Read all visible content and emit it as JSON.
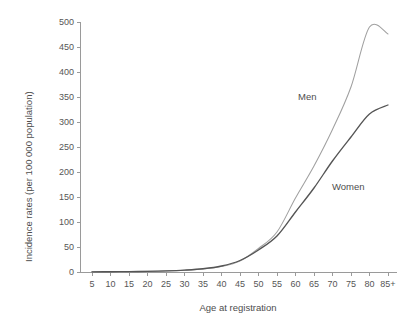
{
  "chart_data": {
    "type": "line",
    "title": "",
    "xlabel": "Age at registration",
    "ylabel": "Incidence rates (per 100 000 population)",
    "categories": [
      "5",
      "10",
      "15",
      "20",
      "25",
      "30",
      "35",
      "40",
      "45",
      "50",
      "55",
      "60",
      "65",
      "70",
      "75",
      "80",
      "85+"
    ],
    "x_tick_labels": [
      "5",
      "10",
      "15",
      "20",
      "25",
      "30",
      "35",
      "40",
      "45",
      "50",
      "55",
      "60",
      "65",
      "70",
      "75",
      "80",
      "85+"
    ],
    "y_tick_labels": [
      "0",
      "50",
      "100",
      "150",
      "200",
      "250",
      "300",
      "350",
      "400",
      "450",
      "500"
    ],
    "y_tick_values": [
      0,
      50,
      100,
      150,
      200,
      250,
      300,
      350,
      400,
      450,
      500
    ],
    "ylim": [
      0,
      500
    ],
    "grid": false,
    "legend_position": "inline-annotation",
    "series": [
      {
        "name": "Men",
        "color": "#a0a0a0",
        "values": [
          0.4,
          0.6,
          0.9,
          1.3,
          2.0,
          3.4,
          6.0,
          11.0,
          22.0,
          47.0,
          80.0,
          148.0,
          212.0,
          285.0,
          370.0,
          490.0,
          476.0
        ]
      },
      {
        "name": "Women",
        "color": "#555555",
        "values": [
          0.4,
          0.6,
          0.9,
          1.3,
          2.2,
          3.8,
          6.5,
          12.0,
          23.0,
          44.0,
          72.0,
          120.0,
          168.0,
          222.0,
          270.0,
          316.0,
          334.0
        ]
      }
    ],
    "annotations": [
      {
        "text": "Men",
        "series": "Men"
      },
      {
        "text": "Women",
        "series": "Women"
      }
    ]
  },
  "colors": {
    "men_line": "#a0a0a0",
    "women_line": "#555555",
    "axis": "#9a9a9a",
    "text": "#4d4d4d",
    "background": "#ffffff"
  }
}
